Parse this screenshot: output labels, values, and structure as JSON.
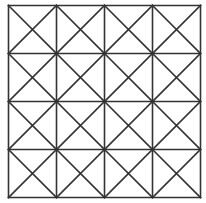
{
  "diagram": {
    "type": "grid-with-diagonals",
    "rows": 4,
    "cols": 4,
    "cell_diagonals": "both",
    "origin": [
      8.5,
      5.5
    ],
    "cell_size": 48,
    "stroke_color": "#333333",
    "stroke_width": 1.6,
    "background": "#ffffff"
  }
}
